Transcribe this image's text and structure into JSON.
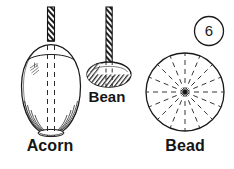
{
  "figure": {
    "number_badge": "6",
    "background_color": "#ffffff",
    "ink_color": "#1a1a1a",
    "type": "line-art-diagram",
    "specimens": [
      {
        "id": "acorn",
        "label": "Acorn",
        "shape": "egg-shaped oval",
        "has_drill": true,
        "has_dashed_axis": true
      },
      {
        "id": "bean",
        "label": "Bean",
        "shape": "flattened ellipse",
        "has_drill": true,
        "has_dashed_axis": true
      },
      {
        "id": "bead",
        "label": "Bead",
        "shape": "circle with radiating dashed spokes",
        "has_drill": false,
        "spoke_count": 16
      }
    ]
  }
}
